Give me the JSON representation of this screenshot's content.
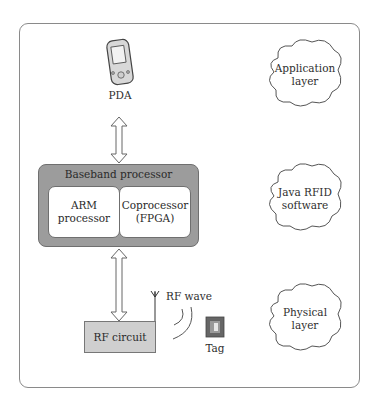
{
  "diagram": {
    "nodes": {
      "pda": {
        "label": "PDA",
        "icon": "pda-device-icon"
      },
      "baseband": {
        "title": "Baseband processor"
      },
      "arm": {
        "line1": "ARM",
        "line2": "processor"
      },
      "coprocessor": {
        "line1": "Coprocessor",
        "line2": "(FPGA)"
      },
      "rf_circuit": {
        "label": "RF circuit"
      },
      "rf_wave": {
        "label": "RF wave"
      },
      "tag": {
        "label": "Tag",
        "icon": "rfid-tag-icon"
      }
    },
    "layers": [
      {
        "line1": "Application",
        "line2": "layer"
      },
      {
        "line1": "Java RFID",
        "line2": "software"
      },
      {
        "line1": "Physical",
        "line2": "layer"
      }
    ],
    "edges": [
      {
        "from": "PDA",
        "to": "Baseband processor",
        "type": "bidirectional"
      },
      {
        "from": "Baseband processor",
        "to": "RF circuit",
        "type": "bidirectional"
      }
    ],
    "colors": {
      "baseband_fill": "#9c9c9c",
      "rf_fill": "#cfcfcf",
      "frame": "#8a8a8a"
    }
  }
}
